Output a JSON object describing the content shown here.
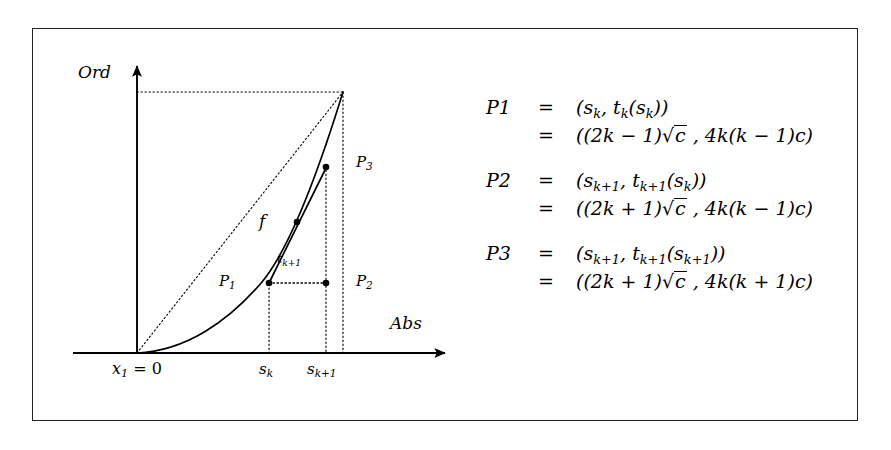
{
  "figure": {
    "kind": "mathematical-diagram",
    "axes": {
      "ordinate_label": "Ord",
      "abscissa_label": "Abs",
      "origin_label_prefix": "x",
      "origin_label_sub": "1",
      "origin_label_suffix": " = 0",
      "tick_sk_base": "s",
      "tick_sk_sub": "k",
      "tick_sk1_base": "s",
      "tick_sk1_sub": "k+1"
    },
    "curve_label": "f",
    "points": [
      {
        "name": "P1",
        "base": "P",
        "sub": "1"
      },
      {
        "name": "P2",
        "base": "P",
        "sub": "2"
      },
      {
        "name": "P3",
        "base": "P",
        "sub": "3"
      }
    ],
    "segment_label": {
      "base": "t",
      "sub": "k+1"
    }
  },
  "equations": [
    {
      "lhs": "P",
      "lhs_sub": "1",
      "rows": [
        {
          "eq": "=",
          "rhs_html": "(<i>s</i><span class=\"sub\">k</span>, <i>t</i><span class=\"sub\">k</span>(<i>s</i><span class=\"sub\">k</span>))"
        },
        {
          "eq": "=",
          "rhs_html": "((2<i>k</i> <span class=\"upr\">&#8722;</span> 1)&#8730;<span class=\"rad\"><i>c</i></span> , 4<i>k</i>(<i>k</i> <span class=\"upr\">&#8722;</span> 1)<i>c</i>)"
        }
      ]
    },
    {
      "lhs": "P",
      "lhs_sub": "2",
      "rows": [
        {
          "eq": "=",
          "rhs_html": "(<i>s</i><span class=\"sub\">k+1</span>, <i>t</i><span class=\"sub\">k+1</span>(<i>s</i><span class=\"sub\">k</span>))"
        },
        {
          "eq": "=",
          "rhs_html": "((2<i>k</i> + 1)&#8730;<span class=\"rad\"><i>c</i></span> , 4<i>k</i>(<i>k</i> <span class=\"upr\">&#8722;</span> 1)<i>c</i>)"
        }
      ]
    },
    {
      "lhs": "P",
      "lhs_sub": "3",
      "rows": [
        {
          "eq": "=",
          "rhs_html": "(<i>s</i><span class=\"sub\">k+1</span>, <i>t</i><span class=\"sub\">k+1</span>(<i>s</i><span class=\"sub\">k+1</span>))"
        },
        {
          "eq": "=",
          "rhs_html": "((2<i>k</i> + 1)&#8730;<span class=\"rad\"><i>c</i></span> , 4<i>k</i>(<i>k</i> + 1)<i>c</i>)"
        }
      ]
    }
  ],
  "chart_data": {
    "type": "line",
    "title": "",
    "xlabel": "Abs",
    "ylabel": "Ord",
    "grid": false,
    "legend": "none",
    "axis_origin_px": [
      137,
      353
    ],
    "curve_points_px": [
      [
        137,
        353
      ],
      [
        160,
        350
      ],
      [
        185,
        344
      ],
      [
        205,
        335
      ],
      [
        225,
        322
      ],
      [
        245,
        303
      ],
      [
        262,
        283
      ],
      [
        280,
        256
      ],
      [
        297,
        222
      ],
      [
        312,
        180
      ],
      [
        325,
        136
      ],
      [
        336,
        108
      ],
      [
        343,
        92
      ]
    ],
    "markers": [
      {
        "label": "P1",
        "px": [
          269,
          283
        ]
      },
      {
        "label": "P2",
        "px": [
          326,
          283
        ]
      },
      {
        "label": "P3",
        "px": [
          326,
          167
        ]
      },
      {
        "label": "tangency",
        "px": [
          297,
          222
        ]
      }
    ],
    "dotted_guides": [
      {
        "name": "diagonal-chord",
        "from_px": [
          137,
          353
        ],
        "to_px": [
          343,
          92
        ]
      },
      {
        "name": "top-horizontal",
        "from_px": [
          137,
          92
        ],
        "to_px": [
          343,
          92
        ]
      },
      {
        "name": "vertical-sk",
        "from_px": [
          269,
          283
        ],
        "to_px": [
          269,
          353
        ]
      },
      {
        "name": "vertical-sk1",
        "from_px": [
          326,
          167
        ],
        "to_px": [
          326,
          353
        ]
      },
      {
        "name": "vertical-right-edge",
        "from_px": [
          343,
          92
        ],
        "to_px": [
          343,
          353
        ]
      },
      {
        "name": "horizontal-p1-p2",
        "from_px": [
          269,
          283
        ],
        "to_px": [
          326,
          283
        ]
      }
    ],
    "solid_segments": [
      {
        "name": "chord-p1-p3",
        "from_px": [
          269,
          283
        ],
        "to_px": [
          326,
          167
        ]
      }
    ],
    "colors": {
      "stroke": "#000000",
      "frame": "#222222",
      "background": "#ffffff"
    }
  }
}
